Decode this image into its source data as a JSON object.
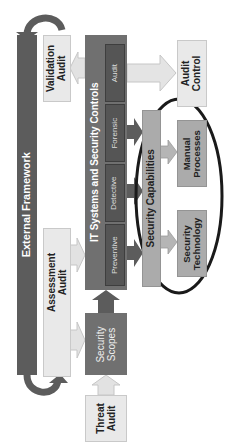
{
  "diagram": {
    "external_framework": "External Framework",
    "validation_audit": [
      "Validation",
      "Audit"
    ],
    "assessment_audit": [
      "Assessment",
      "Audit"
    ],
    "it_systems": "IT Systems and Security Controls",
    "controls": [
      "Audit",
      "Forensic",
      "Detective",
      "Preventive"
    ],
    "security_scopes": [
      "Security",
      "Scopes"
    ],
    "threat_audit": [
      "Threat",
      "Audit"
    ],
    "audit_control": [
      "Audit",
      "Control"
    ],
    "security_capabilities": "Security Capabilities",
    "manual_processes": [
      "Manual",
      "Processes"
    ],
    "security_technology": [
      "Security",
      "Technology"
    ]
  },
  "colors": {
    "dark": "#5c5c5c",
    "light": "#e9e9e9",
    "gray": "#ababab",
    "ellipse": "#1a1a1a"
  }
}
